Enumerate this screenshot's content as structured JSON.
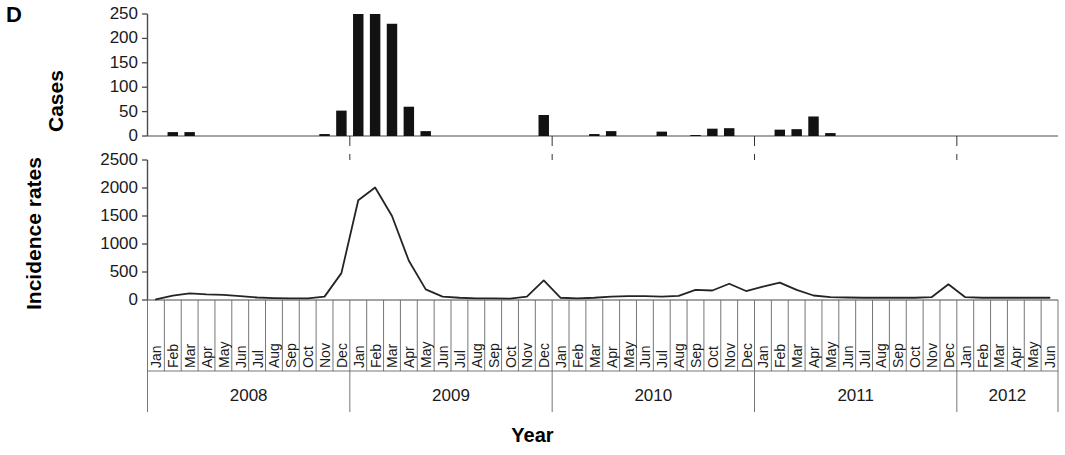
{
  "figure": {
    "panel_letter": "D",
    "x_axis_title": "Year",
    "panels": [
      {
        "id": "cases",
        "y_title": "Cases",
        "y_ticks": [
          "0",
          "50",
          "100",
          "150",
          "200",
          "250"
        ],
        "y_min": 0,
        "y_max": 250
      },
      {
        "id": "incidence",
        "y_title": "Incidence rates",
        "y_ticks": [
          "0",
          "500",
          "1000",
          "1500",
          "2000",
          "2500"
        ],
        "y_min": 0,
        "y_max": 2500
      }
    ],
    "year_labels": [
      "2008",
      "2009",
      "2010",
      "2011",
      "2012"
    ],
    "month_labels": [
      "Jan",
      "Feb",
      "Mar",
      "Apr",
      "May",
      "Jun",
      "Jul",
      "Aug",
      "Sep",
      "Oct",
      "Nov",
      "Dec"
    ],
    "colors": {
      "bar": "#121212",
      "line": "#242424",
      "axis": "#4a4a4a",
      "text": "#111111"
    }
  },
  "chart_data": [
    {
      "type": "bar",
      "title": "Cases",
      "xlabel": "Year",
      "ylabel": "Cases",
      "ylim": [
        0,
        250
      ],
      "yticks": [
        0,
        50,
        100,
        150,
        200,
        250
      ],
      "grid": false,
      "legend": "none",
      "categories": [
        "Jan 2008",
        "Feb 2008",
        "Mar 2008",
        "Apr 2008",
        "May 2008",
        "Jun 2008",
        "Jul 2008",
        "Aug 2008",
        "Sep 2008",
        "Oct 2008",
        "Nov 2008",
        "Dec 2008",
        "Jan 2009",
        "Feb 2009",
        "Mar 2009",
        "Apr 2009",
        "May 2009",
        "Jun 2009",
        "Jul 2009",
        "Aug 2009",
        "Sep 2009",
        "Oct 2009",
        "Nov 2009",
        "Dec 2009",
        "Jan 2010",
        "Feb 2010",
        "Mar 2010",
        "Apr 2010",
        "May 2010",
        "Jun 2010",
        "Jul 2010",
        "Aug 2010",
        "Sep 2010",
        "Oct 2010",
        "Nov 2010",
        "Dec 2010",
        "Jan 2011",
        "Feb 2011",
        "Mar 2011",
        "Apr 2011",
        "May 2011",
        "Jun 2011",
        "Jul 2011",
        "Aug 2011",
        "Sep 2011",
        "Oct 2011",
        "Nov 2011",
        "Dec 2011",
        "Jan 2012",
        "Feb 2012",
        "Mar 2012",
        "Apr 2012",
        "May 2012",
        "Jun 2012"
      ],
      "values": [
        0,
        8,
        8,
        0,
        0,
        0,
        0,
        0,
        0,
        0,
        4,
        52,
        250,
        250,
        230,
        60,
        10,
        0,
        0,
        0,
        0,
        0,
        0,
        43,
        0,
        0,
        4,
        10,
        0,
        0,
        9,
        0,
        2,
        15,
        16,
        0,
        0,
        13,
        14,
        40,
        6,
        0,
        0,
        0,
        0,
        0,
        0,
        0,
        0,
        0,
        0,
        0,
        0,
        0
      ]
    },
    {
      "type": "line",
      "title": "Incidence rates",
      "xlabel": "Year",
      "ylabel": "Incidence rates",
      "ylim": [
        0,
        2500
      ],
      "yticks": [
        0,
        500,
        1000,
        1500,
        2000,
        2500
      ],
      "grid": false,
      "legend": "none",
      "x": [
        "Jan 2008",
        "Feb 2008",
        "Mar 2008",
        "Apr 2008",
        "May 2008",
        "Jun 2008",
        "Jul 2008",
        "Aug 2008",
        "Sep 2008",
        "Oct 2008",
        "Nov 2008",
        "Dec 2008",
        "Jan 2009",
        "Feb 2009",
        "Mar 2009",
        "Apr 2009",
        "May 2009",
        "Jun 2009",
        "Jul 2009",
        "Aug 2009",
        "Sep 2009",
        "Oct 2009",
        "Nov 2009",
        "Dec 2009",
        "Jan 2010",
        "Feb 2010",
        "Mar 2010",
        "Apr 2010",
        "May 2010",
        "Jun 2010",
        "Jul 2010",
        "Aug 2010",
        "Sep 2010",
        "Oct 2010",
        "Nov 2010",
        "Dec 2010",
        "Jan 2011",
        "Feb 2011",
        "Mar 2011",
        "Apr 2011",
        "May 2011",
        "Jun 2011",
        "Jul 2011",
        "Aug 2011",
        "Sep 2011",
        "Oct 2011",
        "Nov 2011",
        "Dec 2011",
        "Jan 2012",
        "Feb 2012",
        "Mar 2012",
        "Apr 2012",
        "May 2012",
        "Jun 2012"
      ],
      "values": [
        10,
        80,
        120,
        100,
        90,
        70,
        45,
        35,
        30,
        30,
        60,
        480,
        1780,
        2010,
        1500,
        700,
        190,
        60,
        40,
        30,
        30,
        25,
        60,
        350,
        40,
        30,
        40,
        60,
        70,
        70,
        60,
        75,
        180,
        170,
        290,
        160,
        240,
        310,
        180,
        80,
        50,
        45,
        40,
        40,
        40,
        40,
        50,
        280,
        50,
        40,
        40,
        40,
        40,
        40
      ]
    }
  ]
}
